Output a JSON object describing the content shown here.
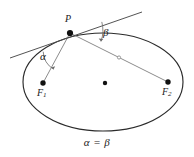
{
  "figure": {
    "type": "geometry-diagram",
    "caption": "α = β",
    "labels": {
      "point_p": "P",
      "focus_1": "F",
      "focus_1_sub": "1",
      "focus_2": "F",
      "focus_2_sub": "2",
      "angle_alpha": "α",
      "angle_beta": "β"
    },
    "colors": {
      "ellipse_stroke": "#2b2b2b",
      "tangent_stroke": "#4a4a4a",
      "radius_stroke": "#8c8c8c",
      "point_fill": "#111111",
      "background": "#ffffff",
      "text": "#1a1a1a"
    },
    "geometry": {
      "ellipse_center_x": 103,
      "ellipse_center_y": 82,
      "ellipse_rx": 80,
      "ellipse_ry": 49,
      "point_p_x": 70,
      "point_p_y": 33,
      "focus_1_x": 43,
      "focus_1_y": 83,
      "focus_2_x": 168,
      "focus_2_y": 82,
      "tangent_start_x": 10,
      "tangent_start_y": 58,
      "tangent_end_x": 142,
      "tangent_end_y": 12
    }
  }
}
